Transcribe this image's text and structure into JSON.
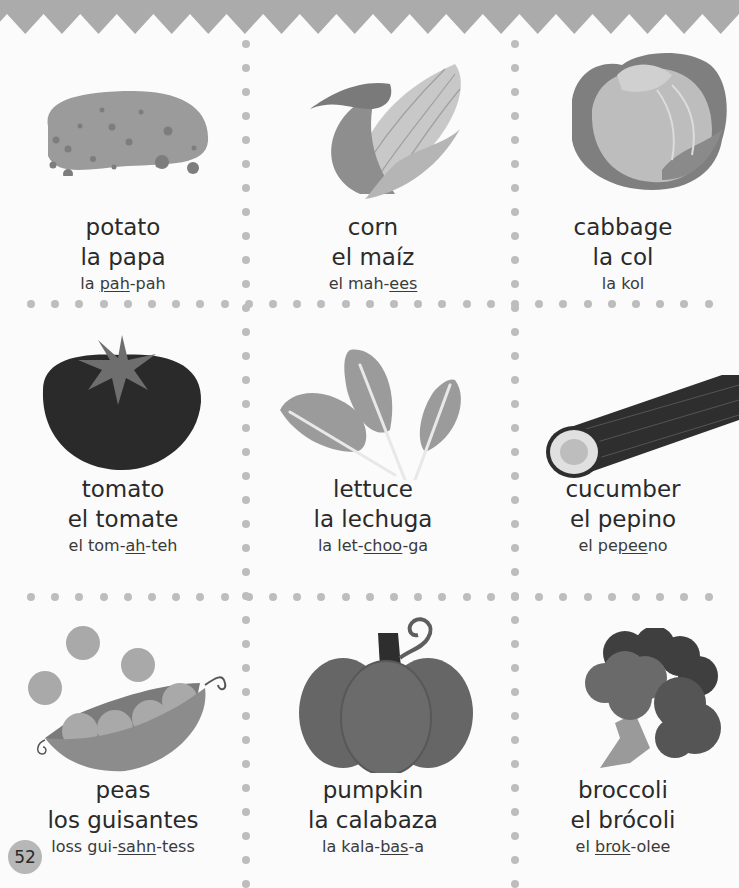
{
  "page": {
    "page_number": "52",
    "header_color": "#ababab",
    "divider_dot_color": "#bdbdbd"
  },
  "cards": [
    {
      "english": "potato",
      "spanish": "la papa",
      "pron_pre": "la ",
      "pron_stress": "pah",
      "pron_post": "-pah",
      "icon": "potato-icon"
    },
    {
      "english": "corn",
      "spanish": "el maíz",
      "pron_pre": "el mah-",
      "pron_stress": "ees",
      "pron_post": "",
      "icon": "corn-icon"
    },
    {
      "english": "cabbage",
      "spanish": "la col",
      "pron_pre": "la kol",
      "pron_stress": "",
      "pron_post": "",
      "icon": "cabbage-icon"
    },
    {
      "english": "tomato",
      "spanish": "el tomate",
      "pron_pre": "el tom-",
      "pron_stress": "ah",
      "pron_post": "-teh",
      "icon": "tomato-icon"
    },
    {
      "english": "lettuce",
      "spanish": "la lechuga",
      "pron_pre": "la let-",
      "pron_stress": "choo",
      "pron_post": "-ga",
      "icon": "lettuce-icon"
    },
    {
      "english": "cucumber",
      "spanish": "el pepino",
      "pron_pre": "el pe",
      "pron_stress": "pee",
      "pron_post": "no",
      "icon": "cucumber-icon"
    },
    {
      "english": "peas",
      "spanish": "los guisantes",
      "pron_pre": "loss gui-",
      "pron_stress": "sahn",
      "pron_post": "-tess",
      "icon": "peas-icon"
    },
    {
      "english": "pumpkin",
      "spanish": "la calabaza",
      "pron_pre": "la kala-",
      "pron_stress": "bas",
      "pron_post": "-a",
      "icon": "pumpkin-icon"
    },
    {
      "english": "broccoli",
      "spanish": "el brócoli",
      "pron_pre": "el ",
      "pron_stress": "brok",
      "pron_post": "-olee",
      "icon": "broccoli-icon"
    }
  ]
}
